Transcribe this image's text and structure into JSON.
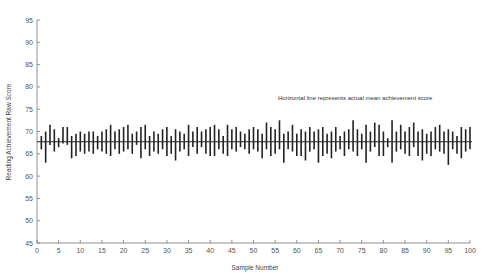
{
  "chart_data": {
    "type": "interval",
    "title": "",
    "xlabel": "Sample Number",
    "ylabel": "Reading Achievement Raw Score",
    "xlim": [
      0,
      100
    ],
    "ylim": [
      45,
      95
    ],
    "x_ticks": [
      0,
      5,
      10,
      15,
      20,
      25,
      30,
      35,
      40,
      45,
      50,
      55,
      60,
      65,
      70,
      75,
      80,
      85,
      90,
      95,
      100
    ],
    "y_ticks": [
      45,
      50,
      55,
      60,
      65,
      70,
      75,
      80,
      85,
      90,
      95
    ],
    "grid": false,
    "reference_line": {
      "orientation": "horizontal",
      "y": 67.7,
      "label": "actual mean achievement score"
    },
    "annotation": "Horizontal line represents actual mean achievement score",
    "series": [
      {
        "name": "Sample confidence intervals",
        "x": [
          1,
          2,
          3,
          4,
          5,
          6,
          7,
          8,
          9,
          10,
          11,
          12,
          13,
          14,
          15,
          16,
          17,
          18,
          19,
          20,
          21,
          22,
          23,
          24,
          25,
          26,
          27,
          28,
          29,
          30,
          31,
          32,
          33,
          34,
          35,
          36,
          37,
          38,
          39,
          40,
          41,
          42,
          43,
          44,
          45,
          46,
          47,
          48,
          49,
          50,
          51,
          52,
          53,
          54,
          55,
          56,
          57,
          58,
          59,
          60,
          61,
          62,
          63,
          64,
          65,
          66,
          67,
          68,
          69,
          70,
          71,
          72,
          73,
          74,
          75,
          76,
          77,
          78,
          79,
          80,
          81,
          82,
          83,
          84,
          85,
          86,
          87,
          88,
          89,
          90,
          91,
          92,
          93,
          94,
          95,
          96,
          97,
          98,
          99,
          100
        ],
        "lower": [
          66.0,
          63.0,
          67.0,
          65.5,
          66.5,
          67.3,
          67.0,
          64.0,
          64.5,
          65.5,
          65.0,
          65.5,
          65.0,
          66.0,
          65.5,
          65.0,
          64.5,
          66.0,
          65.0,
          65.5,
          66.0,
          65.0,
          67.0,
          64.0,
          66.0,
          64.5,
          65.5,
          65.0,
          66.0,
          64.5,
          65.0,
          63.5,
          65.5,
          66.0,
          64.5,
          66.5,
          65.0,
          66.5,
          65.0,
          64.5,
          64.5,
          66.0,
          65.0,
          64.5,
          66.0,
          65.5,
          66.5,
          66.0,
          65.0,
          66.0,
          65.5,
          64.0,
          66.0,
          64.5,
          65.0,
          66.0,
          63.0,
          66.0,
          65.5,
          64.5,
          64.5,
          63.5,
          65.5,
          66.0,
          63.0,
          64.5,
          65.0,
          64.0,
          65.5,
          66.0,
          64.5,
          66.0,
          65.5,
          64.5,
          66.0,
          63.0,
          65.5,
          66.5,
          64.5,
          64.5,
          66.5,
          63.0,
          65.5,
          66.0,
          65.0,
          64.5,
          66.5,
          64.5,
          63.5,
          65.0,
          64.5,
          66.0,
          65.5,
          65.0,
          62.5,
          66.0,
          65.0,
          64.0,
          65.5,
          66.0
        ],
        "upper": [
          69.0,
          70.0,
          71.5,
          70.5,
          68.5,
          71.0,
          71.0,
          69.0,
          69.5,
          70.0,
          69.5,
          70.0,
          70.0,
          69.0,
          70.0,
          70.5,
          71.5,
          70.0,
          70.5,
          71.0,
          71.5,
          69.5,
          70.0,
          71.0,
          71.5,
          69.0,
          70.0,
          69.5,
          70.5,
          71.0,
          69.0,
          70.5,
          70.0,
          69.5,
          71.5,
          70.0,
          71.0,
          70.0,
          70.5,
          71.0,
          71.5,
          70.5,
          69.0,
          71.5,
          70.5,
          71.0,
          70.0,
          69.5,
          70.5,
          71.0,
          70.5,
          69.5,
          72.0,
          71.0,
          70.5,
          72.5,
          69.5,
          70.0,
          71.5,
          69.5,
          70.5,
          70.0,
          71.0,
          70.0,
          70.5,
          71.0,
          69.5,
          70.0,
          71.0,
          69.0,
          70.0,
          70.5,
          72.5,
          70.5,
          69.5,
          71.5,
          70.0,
          72.0,
          71.5,
          70.0,
          68.5,
          72.5,
          70.0,
          71.5,
          70.0,
          71.0,
          72.0,
          70.0,
          70.5,
          69.5,
          70.0,
          71.0,
          71.5,
          70.0,
          70.5,
          70.0,
          69.0,
          71.0,
          70.5,
          71.0
        ]
      }
    ]
  },
  "labels": {
    "xlabel": "Sample Number",
    "ylabel": "Reading Achievement Raw Score",
    "annotation": "Horizontal line represents actual mean achievement score"
  }
}
